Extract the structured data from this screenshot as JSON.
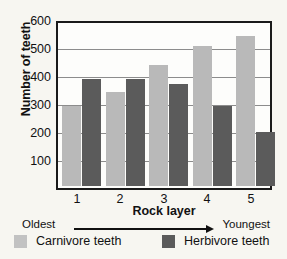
{
  "chart_data": {
    "type": "bar",
    "title": "",
    "xlabel": "Rock layer",
    "ylabel": "Number of teeth",
    "categories": [
      "1",
      "2",
      "3",
      "4",
      "5"
    ],
    "series": [
      {
        "name": "Carnivore teeth",
        "color": "#b9b9b9",
        "values": [
          300,
          350,
          450,
          520,
          560
        ]
      },
      {
        "name": "Herbivore teeth",
        "color": "#5b5b5b",
        "values": [
          400,
          400,
          380,
          300,
          200
        ]
      }
    ],
    "ylim": [
      0,
      600
    ],
    "yticks": [
      100,
      200,
      300,
      400,
      500,
      600
    ],
    "ytick_labels": [
      "100",
      "200",
      "300",
      "400",
      "500",
      "600"
    ],
    "grid": "horizontal",
    "legend_position": "bottom"
  },
  "axis": {
    "y_title": "Number of teeth",
    "x_title": "Rock layer",
    "y_tick_labels": [
      "600",
      "500",
      "400",
      "300",
      "200",
      "100"
    ],
    "x_tick_labels": [
      "1",
      "2",
      "3",
      "4",
      "5"
    ]
  },
  "age_scale": {
    "left_label": "Oldest",
    "right_label": "Youngest",
    "arrow": "arrow-right-icon"
  },
  "legend": {
    "items": [
      {
        "label": "Carnivore teeth",
        "color": "#b9b9b9"
      },
      {
        "label": "Herbivore teeth",
        "color": "#5b5b5b"
      }
    ]
  }
}
